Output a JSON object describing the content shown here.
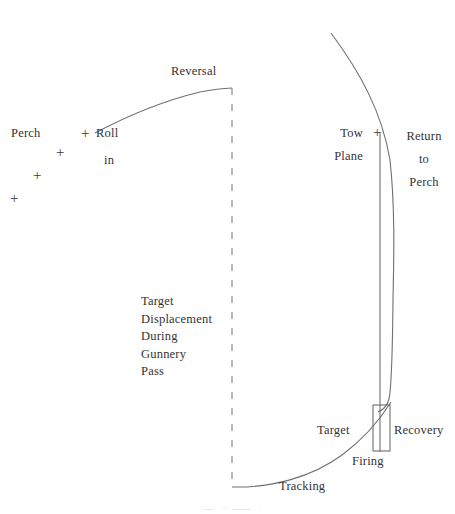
{
  "figure": {
    "background_color": "#ffffff",
    "line_color": "#6b6b6b",
    "text_color": "#333333",
    "width": 455,
    "height": 514
  },
  "labels": {
    "perch": "Perch",
    "roll": "Roll",
    "in": "in",
    "reversal": "Reversal",
    "tow_plane_line1": "Tow",
    "tow_plane_line2": "Plane",
    "return_to_perch": "Return\nto\nPerch",
    "target_displacement": "Target\nDisplacement\nDuring\nGunnery\nPass",
    "target": "Target",
    "recovery": "Recovery",
    "firing": "Firing",
    "tracking": "Tracking",
    "caption_fragment": "·—  ·· ——  ·"
  },
  "markers": {
    "plus_symbol": "+",
    "perch_track": [
      {
        "name": "perch-mark-1",
        "x": 14,
        "y": 198
      },
      {
        "name": "perch-mark-2",
        "x": 36,
        "y": 175
      },
      {
        "name": "perch-mark-3",
        "x": 58,
        "y": 152
      },
      {
        "name": "perch-mark-4",
        "x": 82,
        "y": 127
      }
    ],
    "tow_plane": {
      "name": "tow-plane-mark",
      "x": 374,
      "y": 127
    }
  },
  "geometry": {
    "centerline": {
      "name": "target-displacement-centerline",
      "x": 232,
      "y_top": 88,
      "y_bottom": 487,
      "dash": "7 9"
    },
    "reversal_curve": {
      "start": [
        95,
        132
      ],
      "control": [
        168,
        96
      ],
      "end": [
        232,
        88
      ]
    },
    "outer_return_curve": {
      "start": [
        331,
        33
      ],
      "c1": [
        372,
        92
      ],
      "c2": [
        393,
        180
      ],
      "end": [
        393,
        300
      ],
      "c3": [
        393,
        375
      ],
      "c4": [
        390,
        398
      ],
      "tail": [
        377,
        412
      ]
    },
    "tow_plane_vertical": {
      "x": 380,
      "y_top": 133,
      "y_bottom": 452
    },
    "firing_box": {
      "x": 373,
      "y": 405,
      "width": 17,
      "height": 46
    },
    "tracking_curve": {
      "start": [
        232,
        487
      ],
      "c1": [
        300,
        486
      ],
      "c2": [
        355,
        455
      ],
      "end": [
        390,
        403
      ]
    }
  }
}
